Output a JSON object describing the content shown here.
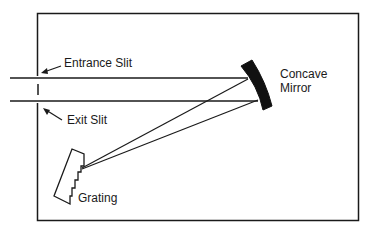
{
  "diagram": {
    "type": "monochromator-schematic",
    "labels": {
      "entrance_slit": "Entrance Slit",
      "exit_slit": "Exit Slit",
      "mirror_line1": "Concave",
      "mirror_line2": "Mirror",
      "grating": "Grating"
    },
    "components": [
      {
        "id": "entrance-slit",
        "label": "Entrance Slit"
      },
      {
        "id": "exit-slit",
        "label": "Exit Slit"
      },
      {
        "id": "concave-mirror",
        "label": "Concave Mirror"
      },
      {
        "id": "grating",
        "label": "Grating"
      }
    ],
    "colors": {
      "stroke": "#1a1a1a",
      "background": "#ffffff"
    }
  }
}
